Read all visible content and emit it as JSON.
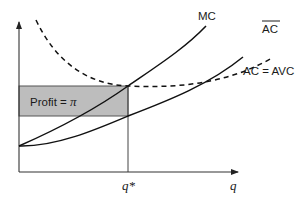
{
  "diagram": {
    "type": "economics-cost-curves",
    "colors": {
      "line": "#111111",
      "axis": "#333333",
      "profit_fill": "#bdbdbd",
      "profit_stroke": "#555555",
      "background": "#ffffff"
    },
    "axes": {
      "x_label": "q",
      "y_label": "",
      "x_tick_label": "q*"
    },
    "curves": [
      {
        "id": "MC",
        "label": "MC",
        "style": "solid"
      },
      {
        "id": "AC_bar",
        "label": "AC",
        "label_overline": true,
        "style": "dashed"
      },
      {
        "id": "AC_AVC",
        "label": "AC = AVC",
        "style": "solid"
      }
    ],
    "region": {
      "label_text": "Profit = ",
      "label_symbol": "π"
    }
  }
}
